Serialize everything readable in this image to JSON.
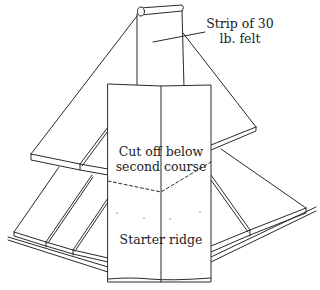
{
  "diagram": {
    "labels": {
      "felt_strip_line1": "Strip of 30",
      "felt_strip_line2": "lb. felt",
      "cutoff_line1": "Cut off below",
      "cutoff_line2": "second course",
      "starter_ridge": "Starter ridge"
    },
    "colors": {
      "stroke": "#2a2a2a",
      "background": "#ffffff",
      "text": "#222222"
    }
  }
}
